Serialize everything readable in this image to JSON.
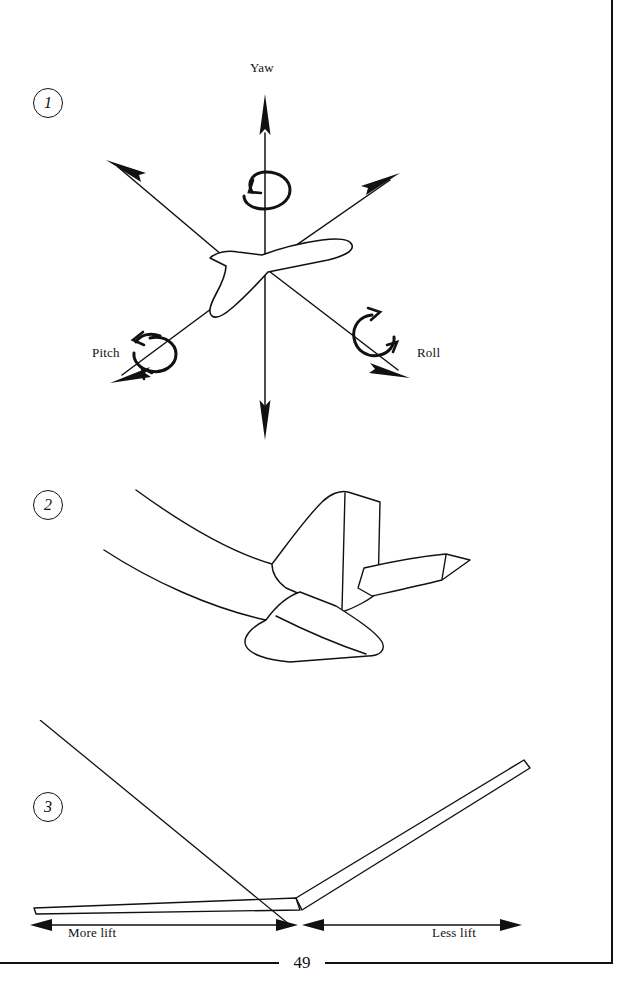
{
  "page": {
    "number": "49",
    "background_color": "#ffffff",
    "ink_color": "#111111"
  },
  "figures": [
    {
      "number": "1",
      "name": "aircraft-flight-axes",
      "labels": {
        "yaw": "Yaw",
        "pitch": "Pitch",
        "roll": "Roll"
      },
      "icons": [
        "yaw-rotation-arrow-icon",
        "pitch-rotation-arrow-icon",
        "roll-rotation-arrow-icon"
      ]
    },
    {
      "number": "2",
      "name": "t-tail-empennage",
      "labels": {},
      "icons": []
    },
    {
      "number": "3",
      "name": "wing-dihedral-lift",
      "labels": {
        "left_span": "More lift",
        "right_span": "Less lift"
      },
      "icons": [
        "dimension-arrow-left-icon",
        "dimension-arrow-right-icon"
      ]
    }
  ]
}
